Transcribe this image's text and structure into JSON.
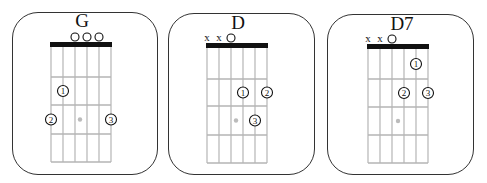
{
  "colors": {
    "border": "#333333",
    "nut": "#111111",
    "fret_line": "#b5b5b5",
    "string_line": "#b5b5b5",
    "marker_dot": "#bbbbbb"
  },
  "chords": [
    {
      "name": "G",
      "card": {
        "x": 12,
        "y": 12,
        "w": 146,
        "h": 163
      },
      "board": {
        "x": 51,
        "y": 42,
        "w": 60,
        "h": 120,
        "nut_h": 5,
        "frets": [
          77,
          105,
          134,
          162
        ]
      },
      "title_x": 82,
      "title_y": 27,
      "string_markers": [
        {
          "string": 3,
          "type": "open"
        },
        {
          "string": 4,
          "type": "open"
        },
        {
          "string": 5,
          "type": "open"
        }
      ],
      "fingers": [
        {
          "label": "1",
          "string": 2,
          "fret": 2
        },
        {
          "label": "2",
          "string": 1,
          "fret": 3
        },
        {
          "label": "3",
          "string": 6,
          "fret": 3
        }
      ],
      "marker": {
        "x": 80,
        "fret": 3
      }
    },
    {
      "name": "D",
      "card": {
        "x": 168,
        "y": 13,
        "w": 147,
        "h": 162
      },
      "board": {
        "x": 207,
        "y": 43,
        "w": 60,
        "h": 120,
        "nut_h": 5,
        "frets": [
          79,
          106,
          135,
          163
        ]
      },
      "title_x": 238,
      "title_y": 29,
      "string_markers": [
        {
          "string": 1,
          "type": "mute",
          "label": "x"
        },
        {
          "string": 2,
          "type": "mute",
          "label": "x"
        },
        {
          "string": 3,
          "type": "open"
        }
      ],
      "fingers": [
        {
          "label": "1",
          "string": 4,
          "fret": 2
        },
        {
          "label": "2",
          "string": 6,
          "fret": 2
        },
        {
          "label": "3",
          "string": 5,
          "fret": 3
        }
      ],
      "marker": {
        "x": 236,
        "fret": 3
      }
    },
    {
      "name": "D7",
      "card": {
        "x": 327,
        "y": 14,
        "w": 147,
        "h": 161
      },
      "board": {
        "x": 368,
        "y": 44,
        "w": 60,
        "h": 119,
        "nut_h": 5,
        "frets": [
          79,
          107,
          135,
          163
        ]
      },
      "title_x": 402,
      "title_y": 30,
      "string_markers": [
        {
          "string": 1,
          "type": "mute",
          "label": "x"
        },
        {
          "string": 2,
          "type": "mute",
          "label": "x"
        },
        {
          "string": 3,
          "type": "open"
        }
      ],
      "fingers": [
        {
          "label": "1",
          "string": 5,
          "fret": 1
        },
        {
          "label": "2",
          "string": 4,
          "fret": 2
        },
        {
          "label": "3",
          "string": 6,
          "fret": 2
        }
      ],
      "marker": {
        "x": 398,
        "fret": 3
      }
    }
  ]
}
